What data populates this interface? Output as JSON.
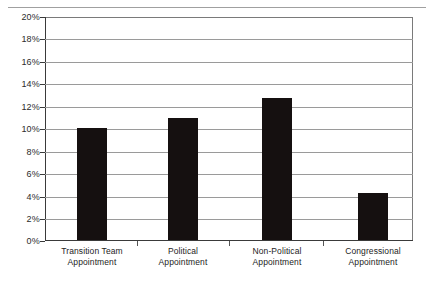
{
  "chart_data": {
    "type": "bar",
    "title": "",
    "subtitle": "",
    "xlabel": "",
    "ylabel": "",
    "categories": [
      "Transition Team Appointment",
      "Political Appointment",
      "Non-Political Appointment",
      "Congressional Appointment"
    ],
    "category_lines": [
      [
        "Transition Team",
        "Appointment"
      ],
      [
        "Political",
        "Appointment"
      ],
      [
        "Non-Political",
        "Appointment"
      ],
      [
        "Congressional",
        "Appointment"
      ]
    ],
    "values": [
      10.0,
      10.9,
      12.7,
      4.2
    ],
    "value_labels": [
      "10.0%",
      "10.9%",
      "12.7%",
      "4.2%"
    ],
    "ylim": [
      0,
      20
    ],
    "ytick_step": 2,
    "ytick_labels": [
      "0%",
      "2%",
      "4%",
      "6%",
      "8%",
      "10%",
      "12%",
      "14%",
      "16%",
      "18%",
      "20%"
    ],
    "ytick_values": [
      0,
      2,
      4,
      6,
      8,
      10,
      12,
      14,
      16,
      18,
      20
    ],
    "grid": true,
    "grid_axis": "y",
    "legend": false,
    "legend_position": "none",
    "bar_color": "#151010",
    "gridline_color": "#9a9a9a",
    "axis_color": "#3a3a3a",
    "background_color": "#ffffff"
  }
}
